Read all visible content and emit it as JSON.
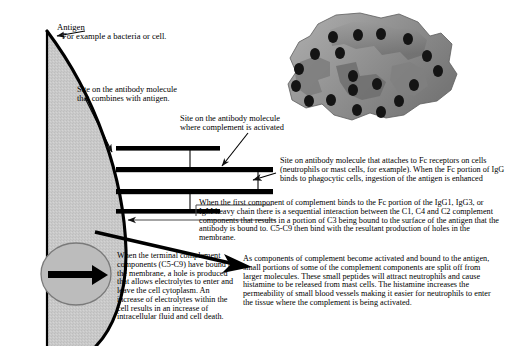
{
  "diagram": {
    "labels": {
      "antigen_title": "Antigen",
      "antigen_subtitle": "For example a bacteria or cell.",
      "combines_with_antigen_line1": "Site on the antibody molecule",
      "combines_with_antigen_line2": "that combines with antigen.",
      "complement_activated_line1": "Site on the antibody molecule",
      "complement_activated_line2": "where complement is activated",
      "fc_receptor_text": "Site on antibody molecule that attaches to Fc receptors on cells (neutrophils or mast cells, for example). When the Fc portion of IgG binds to phagocytic cells, ingestion of the antigen is enhanced",
      "first_component_text": "When the first component of complement binds to the Fc portion of the IgG1, IgG3, or IgM heavy chain there is a sequential interaction between the C1, C4 and C2 complement components that results in a portion of C3 being bound to the surface of the antigen that the antibody is bound to. C5-C9 then bind with the resultant production of holes in the membrane.",
      "terminal_complement_text": "When the terminal complement components (C5-C9) have bound to the membrane, a hole is produced that allows electrolytes to enter and leave the cell cytoplasm. An increase of electrolytes within the cell results in an increase of intracellular fluid and cell death.",
      "complement_activation_text": "As components of complement become activated and bound to the antigen, small portions of some of the complement components are split off from larger molecules. These small peptides will attract neutrophils and cause histamine to be released from mast cells. The histamine increases the permeability of small blood vessels making it easier for neutrophils to enter the tissue where the complement is being activated."
    },
    "colors": {
      "ink": "#000000",
      "cell_fill": "#c9c9c9",
      "membrane_light": "#a8a8a8",
      "membrane_mid": "#8a8a8a",
      "membrane_dark": "#6e6e6e",
      "pore": "#1a1a1a",
      "inset_fill": "#bcbcbc",
      "leader": "#333333"
    }
  }
}
